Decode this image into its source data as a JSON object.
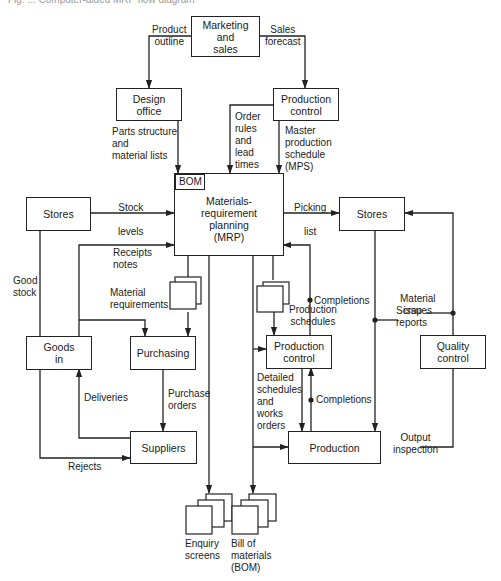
{
  "caption": "Fig. ... Computer-aided MRP flow diagram",
  "nodes": {
    "marketing": "Marketing\nand\nsales",
    "design_office": "Design\noffice",
    "production_control_top": "Production\ncontrol",
    "mrp": "Materials-\nrequirement\nplanning\n(MRP)",
    "bom_tag": "BOM",
    "stores_left": "Stores",
    "stores_right": "Stores",
    "goods_in": "Goods\nin",
    "purchasing": "Purchasing",
    "production_control_mid": "Production\ncontrol",
    "quality_control": "Quality\ncontrol",
    "suppliers": "Suppliers",
    "production": "Production"
  },
  "labels": {
    "product_outline": "Product\noutline",
    "sales_forecast": "Sales\nforecast",
    "parts_structure": "Parts structure\nand\nmaterial lists",
    "order_rules": "Order\nrules\nand\nlead\ntimes",
    "mps": "Master\nproduction\nschedule\n(MPS)",
    "stock_levels": "Stock\n\nlevels",
    "picking_list": "Picking\n\nlist",
    "receipts_notes": "Receipts\nnotes",
    "good_stock": "Good\nstock",
    "material_requirements": "Material\nrequirements",
    "completions_top": "Completions",
    "production_schedules": "Production\nschedules",
    "material_issues": "Material\nissues",
    "scrap_reports": "Scrap\nreports",
    "deliveries": "Deliveries",
    "purchase_orders": "Purchase\norders",
    "detailed_schedules": "Detailed\nschedules\nand\nworks\norders",
    "completions_bottom": "Completions",
    "rejects": "Rejects",
    "output_inspection": "Output\ninspection",
    "enquiry_screens": "Enquiry\nscreens",
    "bill_of_materials": "Bill of\nmaterials\n(BOM)"
  }
}
